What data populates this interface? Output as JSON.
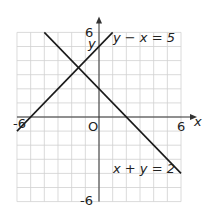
{
  "chart_data": {
    "type": "line",
    "title": "",
    "xlabel": "x",
    "ylabel": "y",
    "xlim": [
      -6,
      6
    ],
    "ylim": [
      -6,
      6
    ],
    "grid": true,
    "tick_labels": {
      "x": [
        "-6",
        "6"
      ],
      "y": [
        "6",
        "-6"
      ],
      "origin": "O"
    },
    "series": [
      {
        "name": "y - x = 5",
        "label": "y − x = 5",
        "points": [
          [
            -6,
            -1
          ],
          [
            1,
            6
          ]
        ]
      },
      {
        "name": "x + y = 2",
        "label": "x + y = 2",
        "points": [
          [
            -4,
            6
          ],
          [
            6,
            -4
          ]
        ]
      }
    ],
    "colors": {
      "grid": "#d0d0d0",
      "axis": "#333333",
      "line": "#1a1a1a"
    }
  }
}
